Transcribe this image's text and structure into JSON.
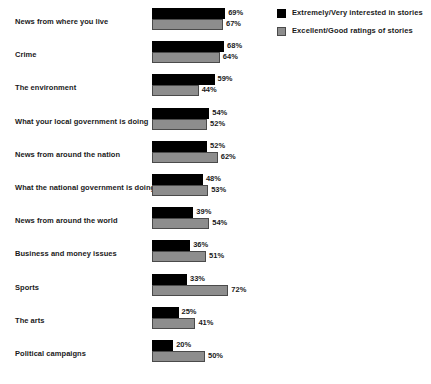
{
  "chart_data": {
    "type": "bar",
    "orientation": "horizontal",
    "title": "",
    "subtitle": "",
    "xlabel": "",
    "ylabel": "",
    "xlim": [
      0,
      100
    ],
    "grid": false,
    "value_suffix": "%",
    "legend_position": "top-right",
    "categories": [
      "News from where you live",
      "Crime",
      "The environment",
      "What your local government is doing",
      "News from around the nation",
      "What the national government is doing",
      "News from around the world",
      "Business and money issues",
      "Sports",
      "The arts",
      "Political campaigns"
    ],
    "series": [
      {
        "name": "Extremely/Very interested in stories",
        "color": "#000000",
        "values": [
          69,
          68,
          59,
          54,
          52,
          48,
          39,
          36,
          33,
          25,
          20
        ],
        "labels": [
          "69%",
          "68%",
          "59%",
          "54%",
          "52%",
          "48%",
          "39%",
          "36%",
          "33%",
          "25%",
          "20%"
        ]
      },
      {
        "name": "Excellent/Good ratings of stories",
        "color": "#8d8d8d",
        "values": [
          67,
          64,
          44,
          52,
          62,
          53,
          54,
          51,
          72,
          41,
          50
        ],
        "labels": [
          "67%",
          "64%",
          "44%",
          "52%",
          "62%",
          "53%",
          "54%",
          "51%",
          "72%",
          "41%",
          "50%"
        ]
      }
    ]
  },
  "legend": {
    "items": [
      {
        "label": "Extremely/Very interested in stories",
        "swatch": "black"
      },
      {
        "label": "Excellent/Good ratings of stories",
        "swatch": "gray"
      }
    ]
  }
}
